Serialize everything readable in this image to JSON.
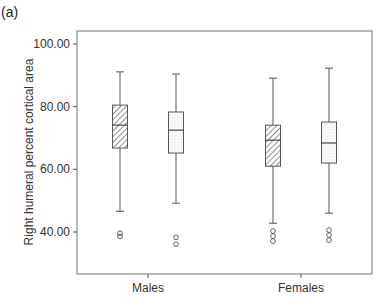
{
  "panel_label": "(a)",
  "chart_data": {
    "type": "boxplot",
    "title": "",
    "xlabel": "",
    "ylabel": "Right humeral percent cortical area",
    "ylim": [
      26,
      104
    ],
    "yticks": [
      40,
      60,
      80,
      100
    ],
    "ytick_labels": [
      "40.00",
      "60.00",
      "80.00",
      "100.00"
    ],
    "grid": false,
    "categories": [
      "Males",
      "Females"
    ],
    "series": [
      {
        "name": "hatched",
        "fill_pattern": "diagonal-hatch",
        "boxes": [
          {
            "category": "Males",
            "whisker_low": 46.6,
            "q1": 66.8,
            "median": 74.1,
            "q3": 80.5,
            "whisker_high": 91.1,
            "outliers": [
              39.6,
              38.6
            ]
          },
          {
            "category": "Females",
            "whisker_low": 42.8,
            "q1": 61.0,
            "median": 69.3,
            "q3": 74.1,
            "whisker_high": 89.1,
            "outliers": [
              40.3,
              38.7,
              37.1
            ]
          }
        ]
      },
      {
        "name": "dotted",
        "fill_pattern": "stipple",
        "boxes": [
          {
            "category": "Males",
            "whisker_low": 49.2,
            "q1": 65.2,
            "median": 72.5,
            "q3": 78.3,
            "whisker_high": 90.4,
            "outliers": [
              38.3,
              36.1
            ]
          },
          {
            "category": "Females",
            "whisker_low": 46.0,
            "q1": 62.0,
            "median": 68.4,
            "q3": 75.1,
            "whisker_high": 92.3,
            "outliers": [
              40.6,
              39.0,
              37.4
            ]
          }
        ]
      }
    ],
    "legend": "none"
  },
  "colors": {
    "line": "#555555",
    "hatch": "#444444",
    "stipple": "#bbbbbb",
    "text": "#333333"
  }
}
